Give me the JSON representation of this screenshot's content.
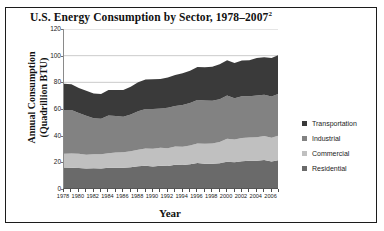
{
  "figure": {
    "title": "U.S. Energy Consumption by Sector, 1978–2007",
    "title_superscript": "2"
  },
  "axes": {
    "ylabel_line1": "Annual Consumption",
    "ylabel_line2": "(Quadrillion BTU)",
    "xlabel": "Year"
  },
  "legend": {
    "items": [
      {
        "label": "Transportation",
        "color": "#3a3a3a"
      },
      {
        "label": "Industrial",
        "color": "#828282"
      },
      {
        "label": "Commercial",
        "color": "#c0c0c0"
      },
      {
        "label": "Residential",
        "color": "#6a6a6a"
      }
    ]
  },
  "chart_data": {
    "type": "area",
    "title": "U.S. Energy Consumption by Sector, 1978–2007",
    "xlabel": "Year",
    "ylabel": "Annual Consumption (Quadrillion BTU)",
    "stacked": true,
    "stack_order": [
      "Residential",
      "Commercial",
      "Industrial",
      "Transportation"
    ],
    "grid": true,
    "legend_position": "right",
    "xlim": [
      1978,
      2007
    ],
    "ylim": [
      0,
      120
    ],
    "yticks": [
      0,
      20,
      40,
      60,
      80,
      100,
      120
    ],
    "xticks": [
      1978,
      1980,
      1982,
      1984,
      1986,
      1988,
      1990,
      1992,
      1994,
      1996,
      1998,
      2000,
      2002,
      2004,
      2006
    ],
    "x": [
      1978,
      1979,
      1980,
      1981,
      1982,
      1983,
      1984,
      1985,
      1986,
      1987,
      1988,
      1989,
      1990,
      1991,
      1992,
      1993,
      1994,
      1995,
      1996,
      1997,
      1998,
      1999,
      2000,
      2001,
      2002,
      2003,
      2004,
      2005,
      2006,
      2007
    ],
    "series": [
      {
        "name": "Residential",
        "color": "#6a6a6a",
        "values": [
          16.1,
          16.0,
          15.8,
          15.3,
          15.5,
          15.4,
          15.9,
          16.0,
          15.9,
          16.3,
          17.0,
          17.5,
          16.9,
          17.4,
          17.3,
          18.2,
          18.0,
          18.5,
          19.5,
          19.0,
          18.9,
          19.3,
          20.4,
          20.1,
          20.9,
          21.2,
          21.2,
          21.8,
          20.7,
          21.8
        ]
      },
      {
        "name": "Commercial",
        "color": "#c0c0c0",
        "values": [
          10.4,
          10.6,
          10.6,
          10.4,
          10.6,
          10.6,
          11.0,
          11.4,
          11.6,
          12.0,
          12.4,
          12.9,
          13.3,
          13.5,
          13.2,
          13.7,
          13.7,
          14.1,
          14.7,
          15.0,
          15.2,
          15.9,
          17.2,
          17.1,
          17.4,
          17.5,
          17.7,
          18.0,
          17.7,
          18.4
        ]
      },
      {
        "name": "Industrial",
        "color": "#828282",
        "values": [
          32.7,
          32.6,
          30.6,
          29.2,
          27.0,
          26.6,
          28.3,
          27.3,
          26.6,
          27.6,
          29.0,
          29.6,
          29.8,
          29.5,
          30.4,
          30.4,
          31.3,
          31.9,
          32.5,
          32.4,
          32.0,
          32.2,
          32.5,
          30.9,
          31.2,
          30.9,
          31.3,
          30.8,
          31.0,
          31.3
        ]
      },
      {
        "name": "Transportation",
        "color": "#3a3a3a",
        "values": [
          19.8,
          19.4,
          18.8,
          18.8,
          18.5,
          18.6,
          19.1,
          19.5,
          20.2,
          20.8,
          21.6,
          22.2,
          22.4,
          22.1,
          22.8,
          23.2,
          23.8,
          24.1,
          24.8,
          25.0,
          25.5,
          26.2,
          26.5,
          26.4,
          26.8,
          27.0,
          28.0,
          28.3,
          28.8,
          29.1
        ]
      }
    ]
  }
}
